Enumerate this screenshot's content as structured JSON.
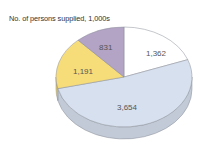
{
  "chart_data": {
    "type": "pie",
    "style": "3d",
    "title": "No. of persons supplied, 1,000s",
    "slices": [
      {
        "label": "1,362",
        "value": 1362,
        "color": "#ffffff"
      },
      {
        "label": "3,654",
        "value": 3654,
        "color": "#d6e0ee"
      },
      {
        "label": "1,191",
        "value": 1191,
        "color": "#f7dc7a"
      },
      {
        "label": "831",
        "value": 831,
        "color": "#b3a3c4"
      }
    ],
    "start_angle_deg": 0,
    "direction": "clockwise",
    "legend": "none"
  },
  "labels": {
    "title": "No. of persons supplied, 1,000s",
    "s0": "1,362",
    "s1": "3,654",
    "s2": "1,191",
    "s3": "831"
  }
}
